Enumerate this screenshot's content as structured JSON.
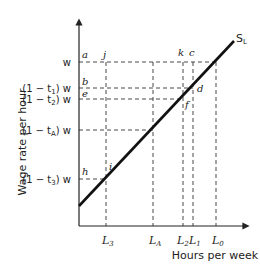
{
  "diagram": {
    "y_axis_label": "Wage rate per hour",
    "x_axis_label": "Hours per week",
    "curve_label": "S",
    "curve_subscript": "L",
    "y_ticks": [
      {
        "id": "w",
        "text": "w",
        "y": 62
      },
      {
        "id": "t1",
        "text": "(1 − t₁) w",
        "y": 88
      },
      {
        "id": "t2",
        "text": "(1 − t₂) w",
        "y": 99
      },
      {
        "id": "tA",
        "text": "(1 − t_A) w",
        "y": 130
      },
      {
        "id": "t3",
        "text": "(1 − t₃) w",
        "y": 179
      }
    ],
    "x_ticks": [
      {
        "id": "L3",
        "text": "L",
        "sub": "3",
        "x": 106
      },
      {
        "id": "LA",
        "text": "L",
        "sub": "A",
        "x": 153
      },
      {
        "id": "L2",
        "text": "L",
        "sub": "2",
        "x": 183
      },
      {
        "id": "L1",
        "text": "L",
        "sub": "1",
        "x": 193
      },
      {
        "id": "L0",
        "text": "L",
        "sub": "0",
        "x": 216
      }
    ],
    "points": {
      "a": "a",
      "b": "b",
      "c": "c",
      "d": "d",
      "e": "e",
      "f": "f",
      "h": "h",
      "i": "i",
      "j": "j",
      "k": "k"
    },
    "y_label_text": {
      "w": "w",
      "t1_pre": "(1 − t",
      "t1_sub": "1",
      "t1_post": ") w",
      "t2_pre": "(1 − t",
      "t2_sub": "2",
      "t2_post": ") w",
      "tA_pre": "(1 − t",
      "tA_sub": "A",
      "tA_post": ") w",
      "t3_pre": "(1 − t",
      "t3_sub": "3",
      "t3_post": ") w"
    }
  }
}
